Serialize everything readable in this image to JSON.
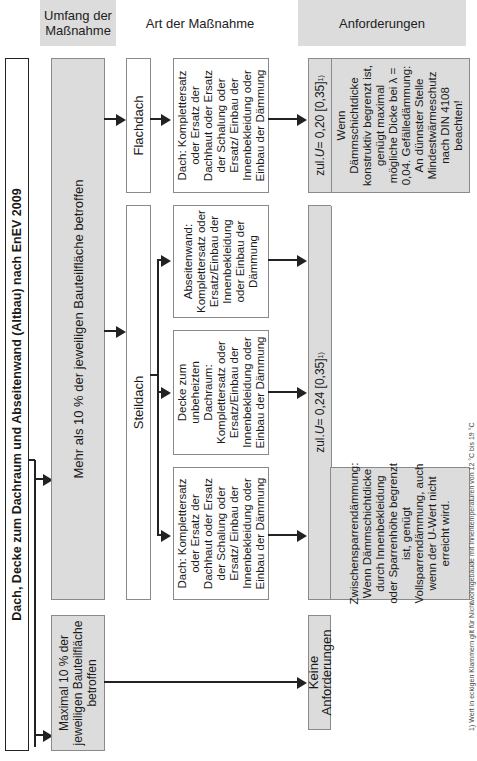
{
  "headers": {
    "umfang": "Umfang der Maßnahme",
    "art": "Art der Maßnahme",
    "anforderungen": "Anforderungen"
  },
  "title": "Dach, Decke zum Dachraum und Abseitenwand (Altbau) nach EnEV 2009",
  "umfang": {
    "mehr": "Mehr als 10 % der jeweiligen Bauteilfläche betroffen",
    "maximal": "Maximal 10 % der jeweiligen Bauteilfläche betroffen"
  },
  "dachtyp": {
    "flachdach": "Flachdach",
    "steildach": "Steildach"
  },
  "massnahmen": {
    "dach_flach": "Dach: Komplettersatz oder Ersatz der Dachhaut oder Ersatz der Schalung oder Ersatz/ Einbau der Innenbekleidung oder Einbau der Dämmung",
    "abseitenwand": "Abseitenwand: Komplettersatz oder Ersatz/Einbau der Innenbekleidung oder Einbau der Dämmung",
    "decke": "Decke zum unbeheizten Dachraum: Komplettersatz oder Ersatz/Einbau der Innenbekleidung oder Einbau der Dämmung",
    "dach_steil": "Dach: Komplettersatz oder Ersatz der Dachhaut oder Ersatz der Schalung oder Ersatz/ Einbau der Innenbekleidung oder Einbau der Dämmung"
  },
  "anforderungen": {
    "flach": {
      "label_prefix": "zul. ",
      "label_u": "U",
      "label_value": " = 0,20 [0,35]",
      "label_sup": "1)",
      "text": "Wenn Dämmschichtdicke konstruktiv begrenzt ist, genügt maximal mögliche Dicke bei λ = 0,04. Gefälledämmung: An dünnster Stelle Mindestwärmeschutz nach DIN 4108 beachten!"
    },
    "steil": {
      "label_prefix": "zul. ",
      "label_u": "U",
      "label_value": " = 0,24 [0,35]",
      "label_sup": "1)",
      "text": "Zwischensparrendämmung: Wenn Dämmschichtdicke durch Innenbekleidung oder Sparrenhöhe begrenzt ist, genügt Vollsparrendämmung, auch wenn der U-Wert nicht erreicht wird."
    },
    "keine": "Keine Anforderungen"
  },
  "footnote": "1) Wert in eckigen Klammern gilt für Nichtwohngebäude mit Innentemperaturen von 12 °C bis 19 °C",
  "colors": {
    "box_gray": "#dcdcdc",
    "border": "#8a8a8a",
    "line": "#222222"
  }
}
